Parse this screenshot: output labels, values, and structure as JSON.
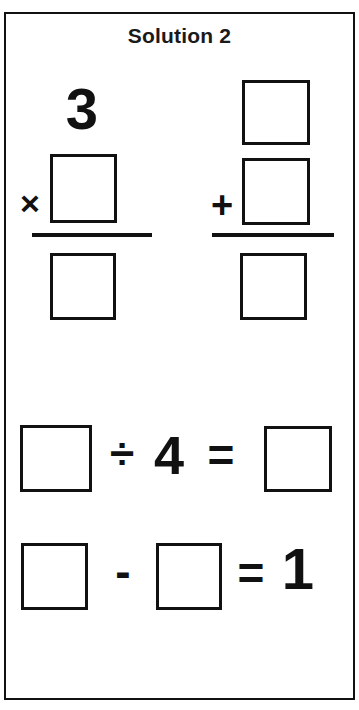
{
  "worksheet": {
    "title": "Solution 2",
    "blank_box_label": "",
    "problems": [
      {
        "id": "multiplication",
        "layout": "vertical",
        "operator": "×",
        "operand_top": "3",
        "operand_bottom": "",
        "result": ""
      },
      {
        "id": "addition",
        "layout": "vertical",
        "operator": "+",
        "operand_top": "",
        "operand_bottom": "",
        "result": ""
      },
      {
        "id": "division",
        "layout": "horizontal",
        "operator": "÷",
        "operand_left": "",
        "operand_right": "4",
        "equals": "=",
        "result": ""
      },
      {
        "id": "subtraction",
        "layout": "horizontal",
        "operator": "-",
        "operand_left": "",
        "operand_right": "",
        "equals": "=",
        "result": "1"
      }
    ]
  },
  "colors": {
    "ink": "#111111",
    "paper": "#ffffff"
  }
}
